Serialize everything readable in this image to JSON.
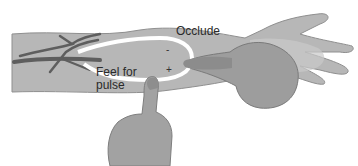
{
  "figure": {
    "labels": {
      "occlude": "Occlude",
      "feel_line1": "Feel for",
      "feel_line2": "pulse"
    },
    "signs": {
      "minus": "-",
      "plus": "+"
    },
    "colors": {
      "arm": "#b4b4b4",
      "arm_edge": "#8a8a8a",
      "vessel_dark": "#5a5a5a",
      "loop": "#ffffff",
      "skin_hand": "#9c9c9c",
      "background": "#ffffff"
    }
  }
}
